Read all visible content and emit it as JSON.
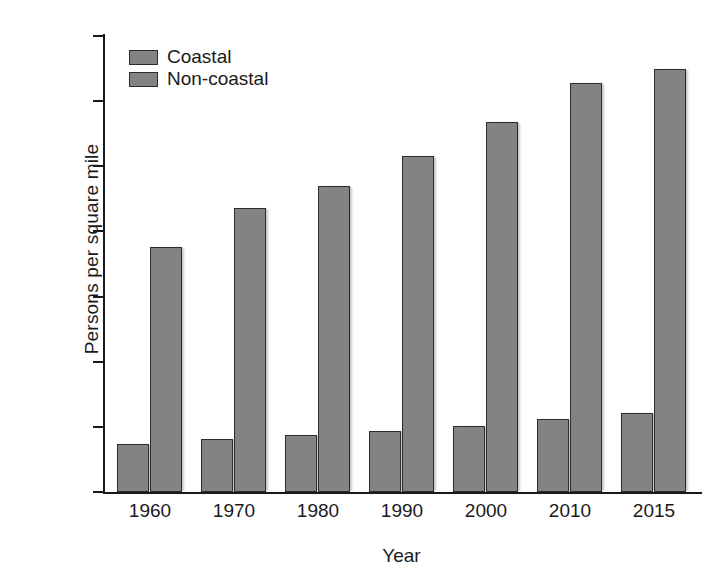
{
  "chart_data": {
    "type": "bar",
    "title": "",
    "xlabel": "Year",
    "ylabel": "Persons per square mile",
    "categories": [
      "1960",
      "1970",
      "1980",
      "1990",
      "2000",
      "2010",
      "2015"
    ],
    "series": [
      {
        "name": "Coastal",
        "values": [
          37,
          41,
          44,
          47,
          51,
          56,
          61
        ],
        "color": "#838383"
      },
      {
        "name": "Non-coastal",
        "values": [
          188,
          218,
          235,
          258,
          284,
          314,
          325
        ],
        "color": "#838383"
      }
    ],
    "ylim": [
      0,
      350
    ],
    "yticks": [
      0,
      50,
      100,
      150,
      200,
      250,
      300,
      350
    ],
    "ytick_labels": [
      "0",
      "50",
      "100",
      "150",
      "200",
      "250",
      "300",
      "350"
    ],
    "grid": false,
    "legend_position": "top-left",
    "legend_entries": [
      "Coastal",
      "Non-coastal"
    ]
  },
  "axes": {
    "x_title": "Year",
    "y_title": "Persons per square mile"
  },
  "colors": {
    "bar_fill": "#838383",
    "bar_border": "#2b2b2b",
    "axis": "#1a1a1a",
    "background": "#ffffff"
  }
}
